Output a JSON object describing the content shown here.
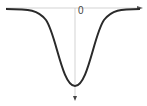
{
  "diagram": {
    "type": "inverted-gaussian",
    "origin_label": "0",
    "colors": {
      "curve": "#2a2a2a",
      "axis": "#bbbbbb",
      "arrow": "#444444"
    }
  }
}
